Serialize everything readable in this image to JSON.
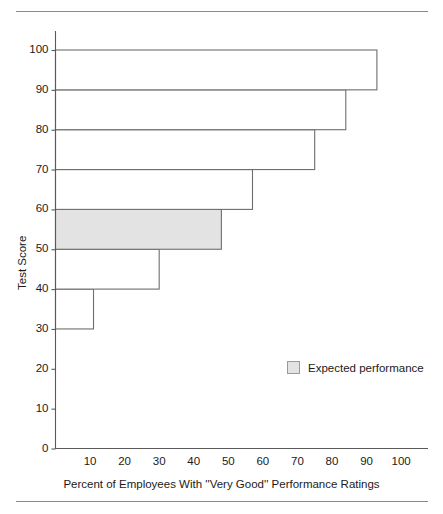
{
  "chart_data": {
    "type": "bar",
    "orientation": "horizontal",
    "title": "",
    "subtitle": "",
    "xlabel": "Percent of Employees With ''Very Good'' Performance Ratings",
    "ylabel": "Test Score",
    "xlim": [
      0,
      105
    ],
    "ylim": [
      0,
      104
    ],
    "grid": false,
    "xticks": [
      10,
      20,
      30,
      40,
      50,
      60,
      70,
      80,
      90,
      100
    ],
    "xticklabels": [
      "10",
      "20",
      "30",
      "40",
      "50",
      "60",
      "70",
      "80",
      "90",
      "100"
    ],
    "yticks": [
      0,
      10,
      20,
      30,
      40,
      50,
      60,
      70,
      80,
      90,
      100
    ],
    "yticklabels": [
      "0",
      "10",
      "20",
      "30",
      "40",
      "50",
      "60",
      "70",
      "80",
      "90",
      "100"
    ],
    "categories": [
      "30-40",
      "40-50",
      "50-60",
      "60-70",
      "70-80",
      "80-90",
      "90-100"
    ],
    "bands": [
      {
        "label": "30-40",
        "y_low": 30,
        "y_high": 40,
        "value": 11,
        "highlight": false
      },
      {
        "label": "40-50",
        "y_low": 40,
        "y_high": 50,
        "value": 30,
        "highlight": false
      },
      {
        "label": "50-60",
        "y_low": 50,
        "y_high": 60,
        "value": 48,
        "highlight": true
      },
      {
        "label": "60-70",
        "y_low": 60,
        "y_high": 70,
        "value": 57,
        "highlight": false
      },
      {
        "label": "70-80",
        "y_low": 70,
        "y_high": 80,
        "value": 75,
        "highlight": false
      },
      {
        "label": "80-90",
        "y_low": 80,
        "y_high": 90,
        "value": 84,
        "highlight": false
      },
      {
        "label": "90-100",
        "y_low": 90,
        "y_high": 100,
        "value": 93,
        "highlight": false
      }
    ],
    "values": [
      11,
      30,
      48,
      57,
      75,
      84,
      93
    ],
    "legend": {
      "position": "inside-lower-right",
      "entries": [
        {
          "label": "Expected performance",
          "color": "#e3e3e3"
        }
      ]
    },
    "colors": {
      "bar_fill": "#ffffff",
      "bar_edge": "#6e6e6e",
      "highlight_fill": "#e3e3e3",
      "axis": "#5a5a5a",
      "rule": "#8a8a8a",
      "text": "#1b1b1b"
    }
  },
  "legend": {
    "expected_performance_label": "Expected performance"
  },
  "axes": {
    "y_title": "Test Score",
    "x_title": "Percent of Employees With ''Very Good'' Performance Ratings"
  }
}
